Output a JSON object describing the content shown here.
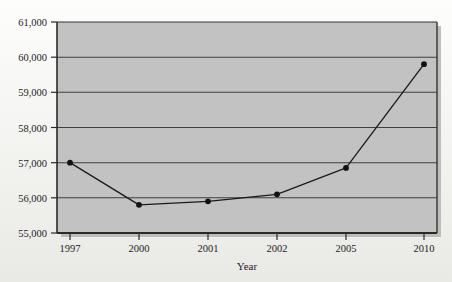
{
  "chart_data": {
    "type": "line",
    "title": "",
    "subtitle": "",
    "xlabel": "Year",
    "ylabel": "",
    "categories": [
      "1997",
      "2000",
      "2001",
      "2002",
      "2005",
      "2010"
    ],
    "values": [
      57000,
      55800,
      55900,
      56100,
      56850,
      59800
    ],
    "series": [
      {
        "name": "",
        "values": [
          57000,
          55800,
          55900,
          56100,
          56850,
          59800
        ]
      }
    ],
    "ylim": [
      55000,
      61000
    ],
    "ytick_labels": [
      "55,000",
      "56,000",
      "57,000",
      "58,000",
      "59,000",
      "60,000",
      "61,000"
    ],
    "ytick_values": [
      55000,
      56000,
      57000,
      58000,
      59000,
      60000,
      61000
    ],
    "xtick_labels": [
      "1997",
      "2000",
      "2001",
      "2002",
      "2005",
      "2010"
    ],
    "grid": true,
    "grid_axis": "horizontal",
    "legend": false,
    "legend_position": "none",
    "marker": "filled-circle",
    "colors": {
      "plot_background": "#c2c2c2",
      "line": "#1a1a1a",
      "marker": "#111111",
      "gridline": "#4a4a4a",
      "axis": "#2a2a2a",
      "page_background": "#f4f4f2",
      "text": "#1b1b1b"
    }
  },
  "figure": {
    "axis_title_x": "Year",
    "y_labels": {
      "t55000": "55,000",
      "t56000": "56,000",
      "t57000": "57,000",
      "t58000": "58,000",
      "t59000": "59,000",
      "t60000": "60,000",
      "t61000": "61,000"
    },
    "x_labels": {
      "c0": "1997",
      "c1": "2000",
      "c2": "2001",
      "c3": "2002",
      "c4": "2005",
      "c5": "2010"
    }
  }
}
